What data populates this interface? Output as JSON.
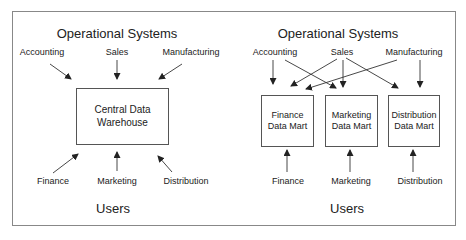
{
  "left_panel": {
    "title": "Operational Systems",
    "sources": [
      "Accounting",
      "Sales",
      "Manufacturing"
    ],
    "warehouse": {
      "line1": "Central Data",
      "line2": "Warehouse"
    },
    "users": [
      "Finance",
      "Marketing",
      "Distribution"
    ],
    "users_title": "Users"
  },
  "right_panel": {
    "title": "Operational Systems",
    "sources": [
      "Accounting",
      "Sales",
      "Manufacturing"
    ],
    "marts": [
      {
        "line1": "Finance",
        "line2": "Data Mart"
      },
      {
        "line1": "Marketing",
        "line2": "Data Mart"
      },
      {
        "line1": "Distribution",
        "line2": "Data Mart"
      }
    ],
    "users": [
      "Finance",
      "Marketing",
      "Distribution"
    ],
    "users_title": "Users"
  },
  "colors": {
    "line": "#222222",
    "frame": "#888888",
    "box_border": "#555555"
  }
}
